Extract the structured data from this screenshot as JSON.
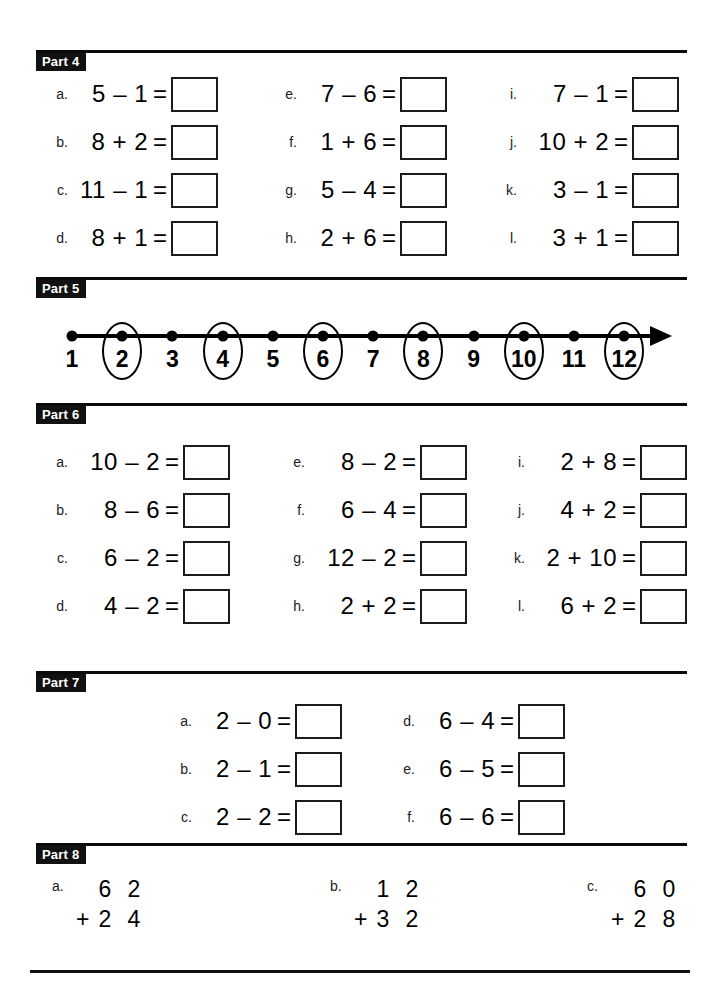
{
  "document": {
    "title": "Math Practice Worksheet",
    "type": "arithmetic-worksheet"
  },
  "sections": [
    {
      "tag": "Part 4",
      "layout": "three-column-fill-in",
      "columns": [
        [
          {
            "letter": "a.",
            "expr": "5 – 1",
            "eq": "=",
            "answer": ""
          },
          {
            "letter": "b.",
            "expr": "8 + 2",
            "eq": "=",
            "answer": ""
          },
          {
            "letter": "c.",
            "expr": "11 – 1",
            "eq": "=",
            "answer": ""
          },
          {
            "letter": "d.",
            "expr": "8 + 1",
            "eq": "=",
            "answer": ""
          }
        ],
        [
          {
            "letter": "e.",
            "expr": "7 – 6",
            "eq": "=",
            "answer": ""
          },
          {
            "letter": "f.",
            "expr": "1 + 6",
            "eq": "=",
            "answer": ""
          },
          {
            "letter": "g.",
            "expr": "5 – 4",
            "eq": "=",
            "answer": ""
          },
          {
            "letter": "h.",
            "expr": "2 + 6",
            "eq": "=",
            "answer": ""
          }
        ],
        [
          {
            "letter": "i.",
            "expr": "7 – 1",
            "eq": "=",
            "answer": ""
          },
          {
            "letter": "j.",
            "expr": "10 + 2",
            "eq": "=",
            "answer": ""
          },
          {
            "letter": "k.",
            "expr": "3 – 1",
            "eq": "=",
            "answer": ""
          },
          {
            "letter": "l.",
            "expr": "3 + 1",
            "eq": "=",
            "answer": ""
          }
        ]
      ]
    },
    {
      "tag": "Part 5",
      "layout": "number-line",
      "number_line": {
        "labels": [
          "1",
          "2",
          "3",
          "4",
          "5",
          "6",
          "7",
          "8",
          "9",
          "10",
          "11",
          "12"
        ],
        "circled": [
          "2",
          "4",
          "6",
          "8",
          "10",
          "12"
        ],
        "has_arrow_right": true,
        "dot_count": 12
      }
    },
    {
      "tag": "Part 6",
      "layout": "three-column-fill-in",
      "columns": [
        [
          {
            "letter": "a.",
            "expr": "10 – 2",
            "eq": "=",
            "answer": ""
          },
          {
            "letter": "b.",
            "expr": "8 – 6",
            "eq": "=",
            "answer": ""
          },
          {
            "letter": "c.",
            "expr": "6 – 2",
            "eq": "=",
            "answer": ""
          },
          {
            "letter": "d.",
            "expr": "4 – 2",
            "eq": "=",
            "answer": ""
          }
        ],
        [
          {
            "letter": "e.",
            "expr": "8 – 2",
            "eq": "=",
            "answer": ""
          },
          {
            "letter": "f.",
            "expr": "6 – 4",
            "eq": "=",
            "answer": ""
          },
          {
            "letter": "g.",
            "expr": "12 – 2",
            "eq": "=",
            "answer": ""
          },
          {
            "letter": "h.",
            "expr": "2 + 2",
            "eq": "=",
            "answer": ""
          }
        ],
        [
          {
            "letter": "i.",
            "expr": "2 + 8",
            "eq": "=",
            "answer": ""
          },
          {
            "letter": "j.",
            "expr": "4 + 2",
            "eq": "=",
            "answer": ""
          },
          {
            "letter": "k.",
            "expr": "2 + 10",
            "eq": "=",
            "answer": ""
          },
          {
            "letter": "l.",
            "expr": "6 + 2",
            "eq": "=",
            "answer": ""
          }
        ]
      ]
    },
    {
      "tag": "Part 7",
      "layout": "two-column-fill-in",
      "columns": [
        [
          {
            "letter": "a.",
            "expr": "2 – 0",
            "eq": "=",
            "answer": ""
          },
          {
            "letter": "b.",
            "expr": "2 – 1",
            "eq": "=",
            "answer": ""
          },
          {
            "letter": "c.",
            "expr": "2 – 2",
            "eq": "=",
            "answer": ""
          }
        ],
        [
          {
            "letter": "d.",
            "expr": "6 – 4",
            "eq": "=",
            "answer": ""
          },
          {
            "letter": "e.",
            "expr": "6 – 5",
            "eq": "=",
            "answer": ""
          },
          {
            "letter": "f.",
            "expr": "6 – 6",
            "eq": "=",
            "answer": ""
          }
        ]
      ]
    },
    {
      "tag": "Part 8",
      "layout": "vertical-addition",
      "problems": [
        {
          "letter": "a.",
          "top": "6 2",
          "operator": "+",
          "bottom": "2 4",
          "answer": ""
        },
        {
          "letter": "b.",
          "top": "1 2",
          "operator": "+",
          "bottom": "3 2",
          "answer": ""
        },
        {
          "letter": "c.",
          "top": "6 0",
          "operator": "+",
          "bottom": "2 8",
          "answer": ""
        }
      ]
    }
  ],
  "colors": {
    "ink": "#000000",
    "tag_background": "#111111",
    "tag_text": "#ffffff",
    "paper": "#ffffff"
  }
}
